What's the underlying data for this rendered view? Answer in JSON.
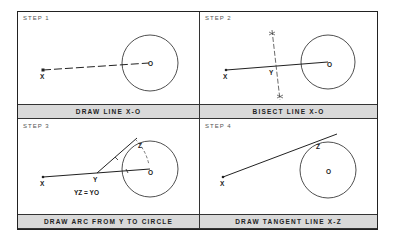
{
  "panels": [
    {
      "step": "STEP 1",
      "caption": "DRAW LINE  X-O",
      "labels": {
        "x": "X",
        "o": "O"
      }
    },
    {
      "step": "STEP 2",
      "caption": "BISECT LINE  X-O",
      "labels": {
        "x": "X",
        "y": "Y",
        "o": "O"
      }
    },
    {
      "step": "STEP 3",
      "caption": "DRAW ARC FROM Y TO CIRCLE",
      "labels": {
        "x": "X",
        "y": "Y",
        "z": "Z",
        "o": "O",
        "eq": "YZ = YO"
      }
    },
    {
      "step": "STEP 4",
      "caption": "DRAW TANGENT LINE  X-Z",
      "labels": {
        "x": "X",
        "z": "Z",
        "o": "O"
      }
    }
  ],
  "colors": {
    "line": "#222222",
    "caption_bg": "#d9d9d9",
    "border": "#333333"
  }
}
